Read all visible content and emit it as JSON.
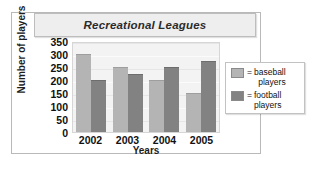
{
  "chart_data": {
    "type": "bar",
    "title": "Recreational Leagues",
    "xlabel": "Years",
    "ylabel": "Number of players",
    "categories": [
      "2002",
      "2003",
      "2004",
      "2005"
    ],
    "series": [
      {
        "name": "= baseball players",
        "key": "baseball",
        "color": "#b4b4b4",
        "values": [
          300,
          250,
          200,
          150
        ]
      },
      {
        "name": "= football players",
        "key": "football",
        "color": "#828282",
        "values": [
          200,
          225,
          250,
          275
        ]
      }
    ],
    "ylim": [
      0,
      350
    ],
    "yticks": [
      350,
      300,
      250,
      200,
      150,
      100,
      50,
      0
    ],
    "grid": true,
    "legend_position": "right",
    "legend": [
      {
        "swatch": "baseball",
        "equals": "=",
        "line1": "baseball",
        "line2": "players"
      },
      {
        "swatch": "football",
        "equals": "=",
        "line1": "football",
        "line2": "players"
      }
    ]
  }
}
